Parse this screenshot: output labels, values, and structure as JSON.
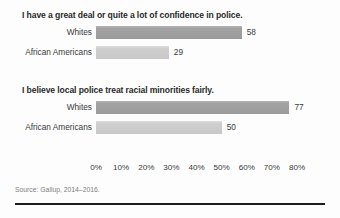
{
  "source_note": "Source: Gallup, 2014–2016.",
  "axis": {
    "ticks": [
      "0%",
      "10%",
      "20%",
      "30%",
      "40%",
      "50%",
      "60%",
      "70%",
      "80%"
    ],
    "min": 0,
    "max": 80
  },
  "panels": [
    {
      "title": "I have a great deal or quite a lot of confidence in police.",
      "rows": [
        {
          "label": "Whites",
          "value": 58,
          "value_text": "58",
          "shade": "dark"
        },
        {
          "label": "African Americans",
          "value": 29,
          "value_text": "29",
          "shade": "light"
        }
      ]
    },
    {
      "title": "I believe local police treat racial minorities fairly.",
      "rows": [
        {
          "label": "Whites",
          "value": 77,
          "value_text": "77",
          "shade": "dark"
        },
        {
          "label": "African Americans",
          "value": 50,
          "value_text": "50",
          "shade": "light"
        }
      ]
    }
  ],
  "colors": {
    "bar_dark": "#9b9b9b",
    "bar_light": "#c8c8c8",
    "text": "#3a3a3a",
    "rule": "#1d1d1d"
  },
  "chart_data": {
    "type": "bar",
    "orientation": "horizontal",
    "title": "",
    "xlabel": "",
    "ylabel": "",
    "xlim": [
      0,
      80
    ],
    "grid": false,
    "legend": "none",
    "source": "Source: Gallup, 2014–2016.",
    "xticks": [
      "0%",
      "10%",
      "20%",
      "30%",
      "40%",
      "50%",
      "60%",
      "70%",
      "80%"
    ],
    "panels": [
      {
        "title": "I have a great deal or quite a lot of confidence in police.",
        "categories": [
          "Whites",
          "African Americans"
        ],
        "values": [
          58,
          29
        ]
      },
      {
        "title": "I believe local police treat racial minorities fairly.",
        "categories": [
          "Whites",
          "African Americans"
        ],
        "values": [
          77,
          50
        ]
      }
    ]
  }
}
